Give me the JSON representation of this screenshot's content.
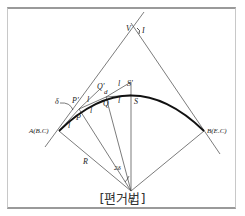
{
  "caption": "[편거법]",
  "labels": {
    "V": "V",
    "I": "I",
    "A": "A(B.C)",
    "B": "B(E.C)",
    "O": "O",
    "R": "R",
    "P": "P",
    "P_prime": "P'",
    "Q": "Q",
    "Q_prime": "Q'",
    "S": "S",
    "S_prime": "S'",
    "delta": "δ",
    "two_delta": "2δ",
    "l": "l"
  }
}
